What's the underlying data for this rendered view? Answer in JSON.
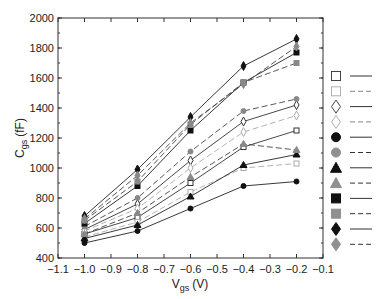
{
  "chart_data": {
    "type": "line",
    "title": "",
    "xlabel": "V_gs (V)",
    "ylabel": "C_gs (fF)",
    "xlabel_main": "V",
    "xlabel_sub": "gs",
    "xlabel_unit": "(V)",
    "ylabel_main": "C",
    "ylabel_sub": "gs",
    "ylabel_unit": "(fF)",
    "xlim": [
      -1.1,
      -0.1
    ],
    "ylim": [
      400,
      2000
    ],
    "xticks": [
      -1.1,
      -1.0,
      -0.9,
      -0.8,
      -0.7,
      -0.6,
      -0.5,
      -0.4,
      -0.3,
      -0.2,
      -0.1
    ],
    "xtick_labels": [
      "−1.1",
      "−1.0",
      "−0.9",
      "−0.8",
      "−0.7",
      "−0.6",
      "−0.5",
      "−0.4",
      "−0.3",
      "−0.2",
      "−0.1"
    ],
    "yticks": [
      400,
      600,
      800,
      1000,
      1200,
      1400,
      1600,
      1800,
      2000
    ],
    "ytick_labels": [
      "400",
      "600",
      "800",
      "1000",
      "1200",
      "1400",
      "1600",
      "1800",
      "2000"
    ],
    "grid": false,
    "legend_position": "right",
    "x": [
      -1.0,
      -0.8,
      -0.6,
      -0.4,
      -0.2
    ],
    "series": [
      {
        "name": "open-square-solid",
        "marker": "square",
        "fill": "none",
        "color": "#333333",
        "line": "solid",
        "values": [
          560,
          670,
          900,
          1140,
          1250
        ]
      },
      {
        "name": "light-open-square-dashed",
        "marker": "square",
        "fill": "none",
        "color": "#aaaaaa",
        "line": "dashed",
        "values": [
          540,
          640,
          840,
          1000,
          1030
        ]
      },
      {
        "name": "open-diamond-solid",
        "marker": "diamond",
        "fill": "none",
        "color": "#333333",
        "line": "solid",
        "values": [
          590,
          760,
          1050,
          1310,
          1420
        ]
      },
      {
        "name": "light-open-diamond-dashed",
        "marker": "diamond",
        "fill": "none",
        "color": "#aaaaaa",
        "line": "dashed",
        "values": [
          580,
          730,
          1000,
          1240,
          1350
        ]
      },
      {
        "name": "black-circle-solid",
        "marker": "circle",
        "fill": "#111111",
        "color": "#222222",
        "line": "solid",
        "values": [
          500,
          580,
          730,
          880,
          910
        ]
      },
      {
        "name": "gray-circle-dashed",
        "marker": "circle",
        "fill": "#888888",
        "color": "#444444",
        "line": "dashed",
        "values": [
          610,
          800,
          1110,
          1380,
          1460
        ]
      },
      {
        "name": "black-triangle-solid",
        "marker": "triangle",
        "fill": "#111111",
        "color": "#222222",
        "line": "solid",
        "values": [
          530,
          620,
          810,
          1020,
          1090
        ]
      },
      {
        "name": "gray-triangle-dashed",
        "marker": "triangle",
        "fill": "#888888",
        "color": "#444444",
        "line": "dashed",
        "values": [
          560,
          700,
          940,
          1160,
          1120
        ]
      },
      {
        "name": "black-square-solid",
        "marker": "square",
        "fill": "#111111",
        "color": "#222222",
        "line": "solid",
        "values": [
          630,
          880,
          1250,
          1570,
          1770
        ]
      },
      {
        "name": "gray-square-dashed",
        "marker": "square",
        "fill": "#888888",
        "color": "#444444",
        "line": "dashed",
        "values": [
          650,
          910,
          1290,
          1570,
          1700
        ]
      },
      {
        "name": "black-diamond-solid",
        "marker": "diamond",
        "fill": "#111111",
        "color": "#222222",
        "line": "solid",
        "values": [
          680,
          990,
          1340,
          1680,
          1860
        ]
      },
      {
        "name": "gray-diamond-dashed",
        "marker": "diamond",
        "fill": "#888888",
        "color": "#444444",
        "line": "dashed",
        "values": [
          660,
          950,
          1300,
          1560,
          1810
        ]
      }
    ],
    "extra_series_note": "",
    "legend": [
      {
        "marker": "square",
        "fill": "none",
        "stroke": "#444444",
        "line": "solid"
      },
      {
        "marker": "square",
        "fill": "none",
        "stroke": "#b0b0b0",
        "line": "dashed"
      },
      {
        "marker": "diamond",
        "fill": "none",
        "stroke": "#444444",
        "line": "solid"
      },
      {
        "marker": "diamond",
        "fill": "none",
        "stroke": "#b0b0b0",
        "line": "dashed"
      },
      {
        "marker": "circle",
        "fill": "#111111",
        "stroke": "#111111",
        "line": "solid"
      },
      {
        "marker": "circle",
        "fill": "#909090",
        "stroke": "#909090",
        "line": "dashed"
      },
      {
        "marker": "triangle",
        "fill": "#111111",
        "stroke": "#111111",
        "line": "solid"
      },
      {
        "marker": "triangle",
        "fill": "#909090",
        "stroke": "#909090",
        "line": "dashed"
      },
      {
        "marker": "square",
        "fill": "#111111",
        "stroke": "#111111",
        "line": "solid"
      },
      {
        "marker": "square",
        "fill": "#909090",
        "stroke": "#909090",
        "line": "dashed"
      },
      {
        "marker": "diamond",
        "fill": "#111111",
        "stroke": "#111111",
        "line": "solid"
      },
      {
        "marker": "diamond",
        "fill": "#909090",
        "stroke": "#909090",
        "line": "dashed"
      }
    ]
  }
}
